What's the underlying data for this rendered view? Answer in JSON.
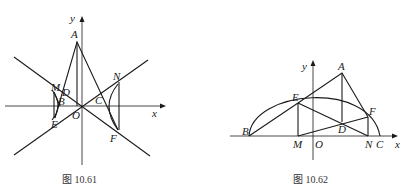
{
  "figures": [
    {
      "id": "fig-10-61",
      "caption": "图 10.61",
      "axis_labels": {
        "x": "x",
        "y": "y"
      },
      "points": {
        "A": "A",
        "M": "M",
        "D": "D",
        "B": "B",
        "O": "O",
        "E": "E",
        "C": "C",
        "N": "N",
        "F": "F"
      },
      "description": "Hyperbola with asymptotes; triangle A-E-F, rectangle M-N-F-E region, lines through O"
    },
    {
      "id": "fig-10-62",
      "caption": "图 10.62",
      "axis_labels": {
        "x": "x",
        "y": "y"
      },
      "points": {
        "A": "A",
        "E": "E",
        "F": "F",
        "B": "B",
        "D": "D",
        "M": "M",
        "O": "O",
        "N": "N",
        "C": "C"
      },
      "description": "Ellipse upper half from B to C; triangle A-E-F, perpendiculars E-M and F-N, point D"
    }
  ]
}
